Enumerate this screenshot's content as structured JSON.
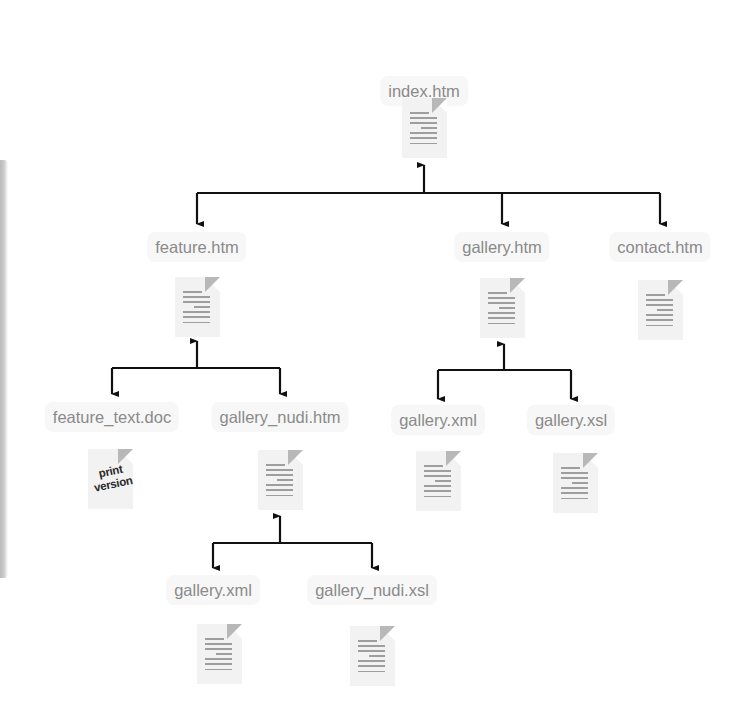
{
  "diagram": {
    "type": "site-structure-tree",
    "nodes": [
      {
        "id": "index",
        "label": "index.htm",
        "icon": "document-icon"
      },
      {
        "id": "feature",
        "label": "feature.htm",
        "icon": "document-icon",
        "parent": "index"
      },
      {
        "id": "gallery",
        "label": "gallery.htm",
        "icon": "document-icon",
        "parent": "index"
      },
      {
        "id": "contact",
        "label": "contact.htm",
        "icon": "document-icon",
        "parent": "index"
      },
      {
        "id": "feature_text",
        "label": "feature_text.doc",
        "icon": "print-version-document-icon",
        "icon_text": [
          "print",
          "version"
        ],
        "parent": "feature"
      },
      {
        "id": "gallery_nudi",
        "label": "gallery_nudi.htm",
        "icon": "document-icon",
        "parent": "feature"
      },
      {
        "id": "gallery_xml",
        "label": "gallery.xml",
        "icon": "document-icon",
        "parent": "gallery"
      },
      {
        "id": "gallery_xsl",
        "label": "gallery.xsl",
        "icon": "document-icon",
        "parent": "gallery"
      },
      {
        "id": "nudi_gallery_xml",
        "label": "gallery.xml",
        "icon": "document-icon",
        "parent": "gallery_nudi"
      },
      {
        "id": "gallery_nudi_xsl",
        "label": "gallery_nudi.xsl",
        "icon": "document-icon",
        "parent": "gallery_nudi"
      }
    ],
    "colors": {
      "label_text": "#8a8a8a",
      "label_bg": "#f7f7f7",
      "doc_bg": "#f2f2f2",
      "doc_lines": "#9e9e9e",
      "connector": "#111111",
      "sidebar_bar": "#c4c4c4"
    }
  }
}
